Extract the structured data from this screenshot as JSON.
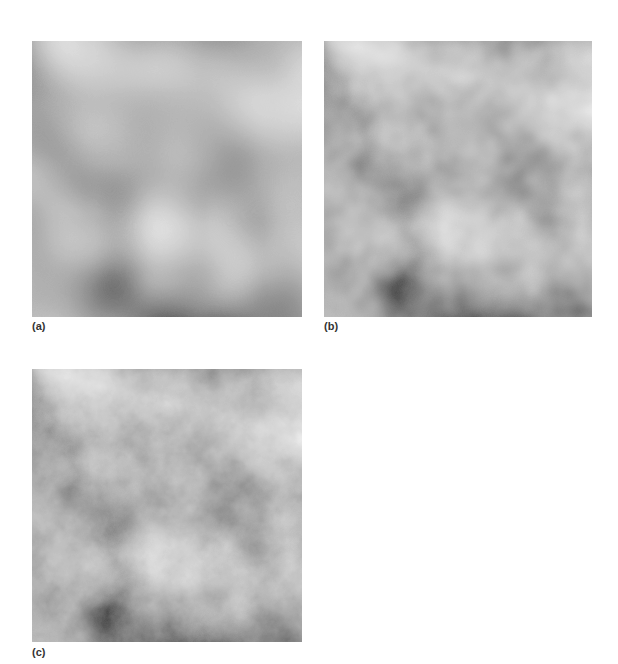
{
  "page": {
    "running_head": {
      "section_text": "",
      "page_number": ""
    }
  },
  "figure": {
    "panels": [
      {
        "id": "a",
        "label": "(a)",
        "description": "Gray fractal noise texture, low detail (few octaves)",
        "octaves": 2
      },
      {
        "id": "b",
        "label": "(b)",
        "description": "Gray fractal noise texture, medium detail",
        "octaves": 4
      },
      {
        "id": "c",
        "label": "(c)",
        "description": "Gray fractal noise texture, high detail",
        "octaves": 6
      }
    ],
    "colors": {
      "dark_tone": "#3a3a3a",
      "light_tone": "#a8a8a8",
      "caption_text": "#333333"
    }
  }
}
